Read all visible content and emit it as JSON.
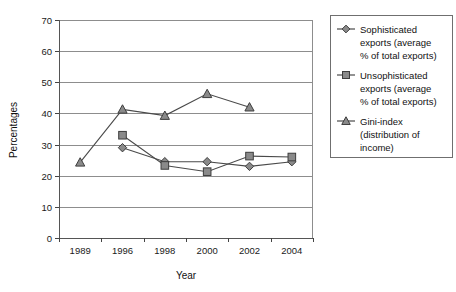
{
  "chart_data": {
    "type": "line",
    "title": "",
    "xlabel": "Year",
    "ylabel": "Percentages",
    "categories": [
      "1989",
      "1996",
      "1998",
      "2000",
      "2002",
      "2004"
    ],
    "ylim": [
      0,
      70
    ],
    "yticks": [
      "0",
      "10",
      "20",
      "30",
      "40",
      "50",
      "60",
      "70"
    ],
    "grid": "horizontal",
    "legend_position": "right",
    "series": [
      {
        "name": "Sophisticated exports (average % of total exports)",
        "marker": "diamond",
        "color": "#8a8a8a",
        "values": [
          null,
          29,
          24.5,
          24.5,
          23,
          24.5
        ]
      },
      {
        "name": "Unsophisticated exports (average % of total exports)",
        "marker": "square",
        "color": "#8a8a8a",
        "values": [
          null,
          33,
          23.3,
          21.3,
          26.3,
          26
        ]
      },
      {
        "name": "Gini-index (distribution of income)",
        "marker": "triangle",
        "color": "#8a8a8a",
        "values": [
          24.3,
          41.3,
          39.3,
          46.3,
          42,
          null
        ]
      }
    ]
  },
  "legend": {
    "entries": [
      {
        "marker": "diamond-marker",
        "lines": [
          "Sophisticated",
          "exports (average",
          "% of total exports)"
        ]
      },
      {
        "marker": "square-marker",
        "lines": [
          "Unsophisticated",
          "exports (average",
          "% of total exports)"
        ]
      },
      {
        "marker": "triangle-marker",
        "lines": [
          "Gini-index",
          "(distribution of",
          "income)"
        ]
      }
    ]
  }
}
